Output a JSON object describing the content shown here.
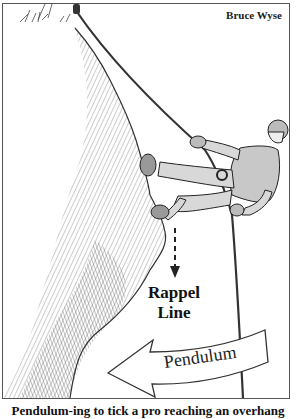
{
  "illustration": {
    "credit": "Bruce Wyse",
    "labels": {
      "rappel_line": [
        "Rappel",
        "Line"
      ],
      "pendulum": "Pendulum"
    },
    "caption": "Pendulum-ing to tick a pro reaching an overhang",
    "colors": {
      "ink": "#222222",
      "frame": "#555555",
      "background": "#ffffff",
      "rock_shade": "#8a8a8a"
    }
  }
}
